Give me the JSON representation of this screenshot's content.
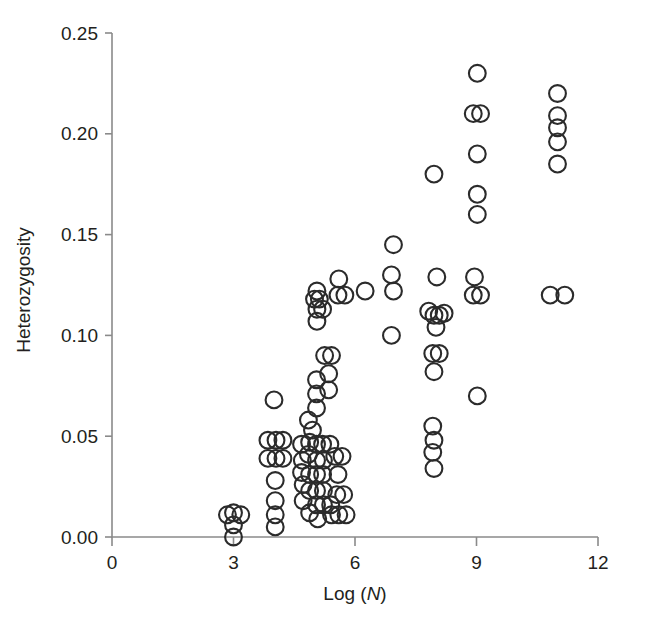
{
  "chart_data": {
    "type": "scatter",
    "title": "",
    "xlabel": "Log (N)",
    "xlabel_plain": "Log (",
    "xlabel_italic": "N",
    "xlabel_close": ")",
    "ylabel": "Heterozygosity",
    "xlim": [
      0,
      12
    ],
    "ylim": [
      0.0,
      0.25
    ],
    "xticks": [
      0,
      3,
      6,
      9,
      12
    ],
    "xtick_labels": [
      "0",
      "3",
      "6",
      "9",
      "12"
    ],
    "yticks": [
      0.0,
      0.05,
      0.1,
      0.15,
      0.2,
      0.25
    ],
    "ytick_labels": [
      "0.00",
      "0.05",
      "0.10",
      "0.15",
      "0.20",
      "0.25"
    ],
    "grid": false,
    "legend": false,
    "marker": {
      "shape": "open-circle",
      "radius": 8.4,
      "stroke": "#2b2b2b",
      "stroke_width": 2.1,
      "fill": "none"
    },
    "axis_color": "#8a8a8a",
    "points": [
      [
        2.85,
        0.011
      ],
      [
        3.0,
        0.012
      ],
      [
        3.18,
        0.011
      ],
      [
        3.0,
        0.006
      ],
      [
        3.0,
        0.0
      ],
      [
        4.0,
        0.068
      ],
      [
        3.85,
        0.048
      ],
      [
        4.05,
        0.048
      ],
      [
        4.22,
        0.048
      ],
      [
        3.85,
        0.039
      ],
      [
        4.05,
        0.039
      ],
      [
        4.22,
        0.039
      ],
      [
        4.03,
        0.028
      ],
      [
        4.03,
        0.018
      ],
      [
        4.03,
        0.011
      ],
      [
        4.03,
        0.005
      ],
      [
        5.0,
        0.118
      ],
      [
        5.12,
        0.118
      ],
      [
        5.06,
        0.113
      ],
      [
        5.06,
        0.122
      ],
      [
        5.2,
        0.113
      ],
      [
        5.06,
        0.107
      ],
      [
        5.6,
        0.128
      ],
      [
        5.58,
        0.12
      ],
      [
        5.75,
        0.12
      ],
      [
        6.25,
        0.122
      ],
      [
        6.95,
        0.122
      ],
      [
        5.05,
        0.078
      ],
      [
        5.05,
        0.071
      ],
      [
        5.05,
        0.064
      ],
      [
        4.85,
        0.058
      ],
      [
        4.95,
        0.053
      ],
      [
        4.88,
        0.047
      ],
      [
        4.85,
        0.041
      ],
      [
        5.25,
        0.09
      ],
      [
        5.42,
        0.09
      ],
      [
        5.35,
        0.081
      ],
      [
        5.35,
        0.073
      ],
      [
        4.68,
        0.046
      ],
      [
        4.7,
        0.038
      ],
      [
        4.68,
        0.032
      ],
      [
        4.72,
        0.026
      ],
      [
        5.05,
        0.046
      ],
      [
        5.2,
        0.046
      ],
      [
        5.38,
        0.046
      ],
      [
        5.05,
        0.038
      ],
      [
        5.22,
        0.038
      ],
      [
        4.88,
        0.031
      ],
      [
        5.05,
        0.031
      ],
      [
        5.2,
        0.031
      ],
      [
        4.88,
        0.023
      ],
      [
        5.05,
        0.023
      ],
      [
        5.22,
        0.023
      ],
      [
        5.5,
        0.04
      ],
      [
        5.68,
        0.04
      ],
      [
        5.58,
        0.031
      ],
      [
        4.72,
        0.018
      ],
      [
        4.88,
        0.012
      ],
      [
        5.05,
        0.016
      ],
      [
        5.22,
        0.016
      ],
      [
        5.4,
        0.016
      ],
      [
        5.55,
        0.021
      ],
      [
        5.72,
        0.021
      ],
      [
        5.42,
        0.011
      ],
      [
        5.6,
        0.011
      ],
      [
        5.78,
        0.011
      ],
      [
        5.08,
        0.009
      ],
      [
        6.95,
        0.145
      ],
      [
        6.9,
        0.13
      ],
      [
        6.9,
        0.1
      ],
      [
        7.95,
        0.18
      ],
      [
        8.02,
        0.129
      ],
      [
        7.82,
        0.112
      ],
      [
        7.95,
        0.11
      ],
      [
        8.08,
        0.11
      ],
      [
        8.2,
        0.111
      ],
      [
        8.0,
        0.104
      ],
      [
        7.92,
        0.091
      ],
      [
        8.08,
        0.091
      ],
      [
        7.95,
        0.082
      ],
      [
        7.92,
        0.055
      ],
      [
        7.95,
        0.048
      ],
      [
        7.92,
        0.042
      ],
      [
        7.95,
        0.034
      ],
      [
        9.02,
        0.23
      ],
      [
        8.92,
        0.21
      ],
      [
        9.1,
        0.21
      ],
      [
        9.02,
        0.19
      ],
      [
        9.02,
        0.17
      ],
      [
        9.02,
        0.16
      ],
      [
        8.95,
        0.129
      ],
      [
        8.92,
        0.12
      ],
      [
        9.1,
        0.12
      ],
      [
        9.02,
        0.07
      ],
      [
        11.0,
        0.22
      ],
      [
        11.0,
        0.209
      ],
      [
        11.0,
        0.203
      ],
      [
        11.0,
        0.196
      ],
      [
        11.0,
        0.185
      ],
      [
        10.82,
        0.12
      ],
      [
        11.18,
        0.12
      ]
    ],
    "n_points": 101
  }
}
